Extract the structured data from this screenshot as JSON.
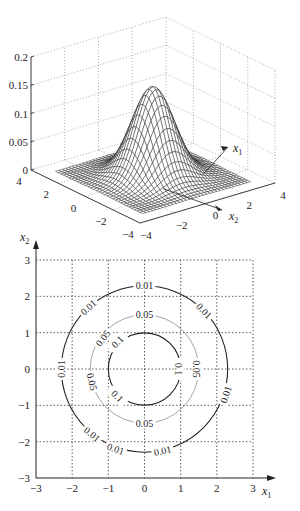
{
  "chart_data": [
    {
      "type": "surface",
      "title": "",
      "function": "bivariate standard normal density",
      "xlabel": "x1",
      "ylabel": "x2",
      "zlabel": "",
      "xlim": [
        -4,
        4
      ],
      "ylim": [
        -4,
        4
      ],
      "zlim": [
        0,
        0.2
      ],
      "x_ticks": [
        -4,
        -2,
        0,
        2,
        4
      ],
      "y_ticks": [
        -4,
        -2,
        0,
        2,
        4
      ],
      "z_ticks": [
        0,
        0.05,
        0.1,
        0.15,
        0.2
      ],
      "x_tick_labels": [
        "-4",
        "-2",
        "0",
        "2",
        "4"
      ],
      "y_tick_labels": [
        "4",
        "2",
        "0",
        "-2",
        "-4"
      ],
      "z_tick_labels": [
        "0",
        "0.05",
        "0.1",
        "0.15",
        "0.2"
      ],
      "peak": {
        "x1": 0,
        "x2": 0,
        "z": 0.159
      },
      "grid": true,
      "mesh_color": "#222222"
    },
    {
      "type": "contour",
      "title": "",
      "xlabel": "x1",
      "ylabel": "x2",
      "xlim": [
        -3,
        3
      ],
      "ylim": [
        -3,
        3
      ],
      "x_ticks": [
        -3,
        -2,
        -1,
        0,
        1,
        2,
        3
      ],
      "y_ticks": [
        -3,
        -2,
        -1,
        0,
        1,
        2,
        3
      ],
      "x_tick_labels": [
        "-3",
        "-2",
        "-1",
        "0",
        "1",
        "2",
        "3"
      ],
      "y_tick_labels": [
        "-3",
        "-2",
        "-1",
        "0",
        "1",
        "2",
        "3"
      ],
      "grid": "dotted",
      "levels": [
        {
          "value": 0.1,
          "label": "0.1",
          "radius": 1.0,
          "color": "#222222",
          "label_positions": [
            [
              -0.75,
              0.75
            ],
            [
              0.95,
              0.0
            ],
            [
              -0.75,
              -0.75
            ]
          ]
        },
        {
          "value": 0.05,
          "label": "0.05",
          "radius": 1.5,
          "color": "#9a9a9a",
          "label_positions": [
            [
              -1.15,
              0.85
            ],
            [
              0.0,
              1.5
            ],
            [
              1.45,
              0.0
            ],
            [
              -1.45,
              -0.35
            ],
            [
              0.0,
              -1.5
            ]
          ]
        },
        {
          "value": 0.01,
          "label": "0.01",
          "radius": 2.3,
          "color": "#222222",
          "label_positions": [
            [
              -1.55,
              1.7
            ],
            [
              0.0,
              2.3
            ],
            [
              1.65,
              1.6
            ],
            [
              -2.3,
              0.0
            ],
            [
              2.25,
              -0.7
            ],
            [
              -1.45,
              -1.8
            ],
            [
              -0.8,
              -2.2
            ],
            [
              0.5,
              -2.25
            ]
          ]
        }
      ]
    }
  ],
  "labels": {
    "x1": "x",
    "x1_sub": "1",
    "x2": "x",
    "x2_sub": "2"
  }
}
